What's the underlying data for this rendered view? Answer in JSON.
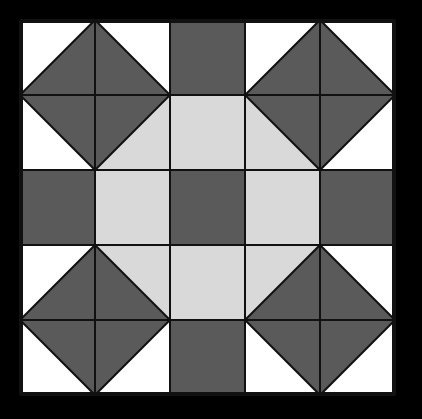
{
  "canvas": {
    "width": 422,
    "height": 419,
    "background_color": "#ffffff",
    "title": "Quilt Block Pattern Diagram"
  },
  "colors": {
    "dark": "#5a5a5a",
    "light": "#d9d9d9",
    "white": "#ffffff",
    "line": "#111111",
    "background": "#ffffff"
  },
  "block": {
    "name": "pieced-quilt-block",
    "origin_x": 20,
    "origin_y": 20,
    "size": 375,
    "grid_divisions": 5,
    "cell_size": 75,
    "border_width": 3,
    "inner_line_width": 2,
    "grid_lines_x": [
      20,
      95,
      170,
      245,
      320,
      395
    ],
    "grid_lines_y": [
      20,
      95,
      170,
      245,
      320,
      395
    ],
    "description": "Five-by-five patchwork quilt block with four corner diamonds, four dark edge bars, a light octagon ring and a dark center square."
  },
  "regions": {
    "corner_diamonds": [
      {
        "name": "top-left-diamond",
        "fill": "dark",
        "cx": 95,
        "cy": 95,
        "half": 75
      },
      {
        "name": "top-right-diamond",
        "fill": "dark",
        "cx": 320,
        "cy": 95,
        "half": 75
      },
      {
        "name": "bottom-left-diamond",
        "fill": "dark",
        "cx": 95,
        "cy": 320,
        "half": 75
      },
      {
        "name": "bottom-right-diamond",
        "fill": "dark",
        "cx": 320,
        "cy": 320,
        "half": 75
      }
    ],
    "edge_bars": [
      {
        "name": "top-edge-bar",
        "fill": "dark",
        "x": 170,
        "y": 20,
        "w": 75,
        "h": 75
      },
      {
        "name": "bottom-edge-bar",
        "fill": "dark",
        "x": 170,
        "y": 320,
        "w": 75,
        "h": 75
      },
      {
        "name": "left-edge-bar",
        "fill": "dark",
        "x": 20,
        "y": 170,
        "w": 75,
        "h": 75
      },
      {
        "name": "right-edge-bar",
        "fill": "dark",
        "x": 320,
        "y": 170,
        "w": 75,
        "h": 75
      }
    ],
    "octagon_ring": [
      {
        "name": "octagon-top-cell",
        "fill": "light",
        "x": 170,
        "y": 95,
        "w": 75,
        "h": 75
      },
      {
        "name": "octagon-bottom-cell",
        "fill": "light",
        "x": 170,
        "y": 245,
        "w": 75,
        "h": 75
      },
      {
        "name": "octagon-left-cell",
        "fill": "light",
        "x": 95,
        "y": 170,
        "w": 75,
        "h": 75
      },
      {
        "name": "octagon-right-cell",
        "fill": "light",
        "x": 245,
        "y": 170,
        "w": 75,
        "h": 75
      },
      {
        "name": "octagon-corner-nw",
        "fill": "split-dark-light",
        "x": 95,
        "y": 95,
        "w": 75,
        "h": 75,
        "diagonal": "nw-dark"
      },
      {
        "name": "octagon-corner-ne",
        "fill": "split-dark-light",
        "x": 245,
        "y": 95,
        "w": 75,
        "h": 75,
        "diagonal": "ne-dark"
      },
      {
        "name": "octagon-corner-sw",
        "fill": "split-dark-light",
        "x": 95,
        "y": 245,
        "w": 75,
        "h": 75,
        "diagonal": "sw-dark"
      },
      {
        "name": "octagon-corner-se",
        "fill": "split-dark-light",
        "x": 245,
        "y": 245,
        "w": 75,
        "h": 75,
        "diagonal": "se-dark"
      }
    ],
    "center": {
      "name": "center-square",
      "fill": "dark",
      "x": 170,
      "y": 170,
      "w": 75,
      "h": 75
    },
    "white_corners": [
      {
        "name": "white-corner-top-left",
        "x": 20,
        "y": 20
      },
      {
        "name": "white-corner-top-right",
        "x": 245,
        "y": 20
      },
      {
        "name": "white-corner-bottom-left",
        "x": 20,
        "y": 245
      },
      {
        "name": "white-corner-bottom-right",
        "x": 245,
        "y": 245
      }
    ]
  }
}
